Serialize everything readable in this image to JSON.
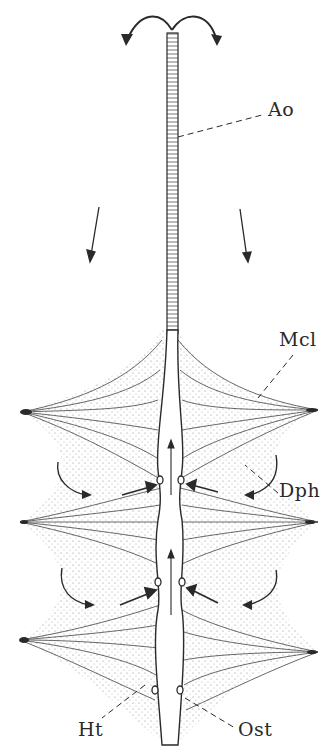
{
  "figure": {
    "ink_color": "#2a2a2a",
    "background": "#ffffff"
  },
  "labels": {
    "aorta": "Ao",
    "alary_muscle": "Mcl",
    "dorsal_diaphragm": "Dph",
    "heart": "Ht",
    "ostium": "Ost"
  },
  "flow_arrows": {
    "top": "bidirectional outflow from aorta tip",
    "descending": 2,
    "into_ostia": 4,
    "lateral_curved": 4,
    "internal_upward": 2
  }
}
